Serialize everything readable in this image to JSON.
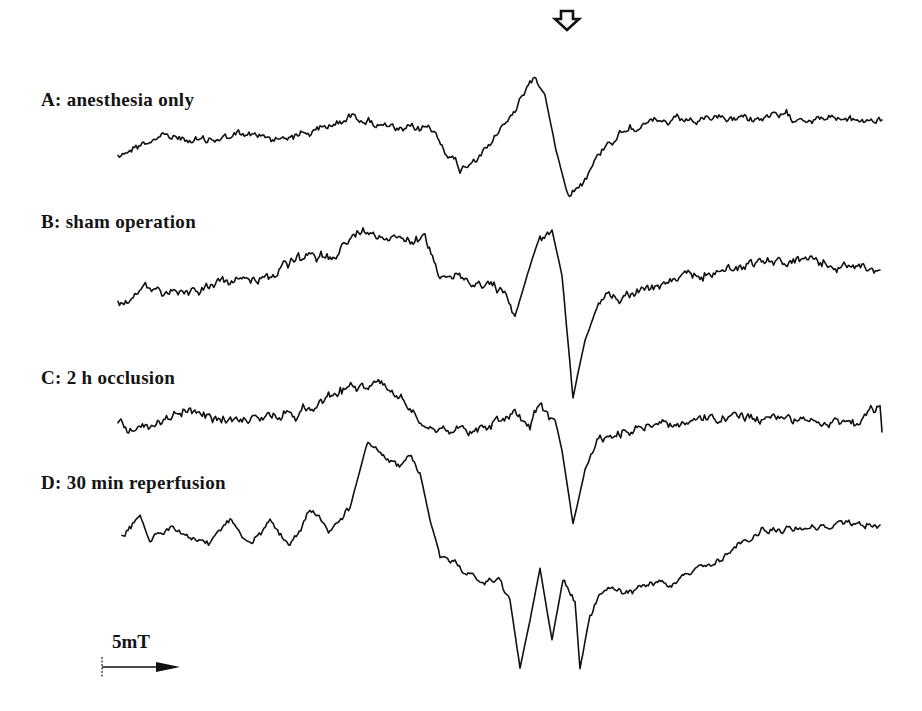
{
  "figure": {
    "marker": "down-arrow-outline",
    "scale_bar": {
      "label": "5mT",
      "direction": "right"
    }
  },
  "labels": {
    "A": "A: anesthesia only",
    "B": "B: sham operation",
    "C": "C: 2 h  occlusion",
    "D": "D: 30 min reperfusion",
    "scale": "5mT"
  },
  "chart_data": {
    "type": "line",
    "title": "",
    "xlabel": "Magnetic field (scale bar 5mT)",
    "ylabel": "",
    "grid": false,
    "legend": "none (inline labels above each trace)",
    "annotations": [
      "open down-arrow marker above center resonance (~x=567)",
      "5mT scale bar arrow at bottom-left"
    ],
    "series": [
      {
        "name": "A: anesthesia only",
        "anchors_px": [
          [
            118,
            155
          ],
          [
            160,
            135
          ],
          [
            200,
            142
          ],
          [
            240,
            135
          ],
          [
            280,
            138
          ],
          [
            320,
            130
          ],
          [
            355,
            115
          ],
          [
            400,
            132
          ],
          [
            430,
            127
          ],
          [
            460,
            170
          ],
          [
            490,
            145
          ],
          [
            515,
            110
          ],
          [
            533,
            75
          ],
          [
            545,
            95
          ],
          [
            556,
            150
          ],
          [
            568,
            195
          ],
          [
            585,
            178
          ],
          [
            605,
            145
          ],
          [
            630,
            125
          ],
          [
            680,
            122
          ],
          [
            740,
            118
          ],
          [
            800,
            117
          ],
          [
            850,
            120
          ],
          [
            882,
            120
          ]
        ],
        "noise": 5
      },
      {
        "name": "B: sham operation",
        "anchors_px": [
          [
            118,
            305
          ],
          [
            150,
            290
          ],
          [
            190,
            290
          ],
          [
            230,
            282
          ],
          [
            270,
            275
          ],
          [
            300,
            260
          ],
          [
            330,
            255
          ],
          [
            345,
            245
          ],
          [
            360,
            232
          ],
          [
            400,
            235
          ],
          [
            425,
            240
          ],
          [
            440,
            272
          ],
          [
            470,
            282
          ],
          [
            500,
            288
          ],
          [
            515,
            318
          ],
          [
            528,
            272
          ],
          [
            540,
            236
          ],
          [
            552,
            230
          ],
          [
            562,
            275
          ],
          [
            573,
            398
          ],
          [
            585,
            340
          ],
          [
            600,
            300
          ],
          [
            640,
            290
          ],
          [
            700,
            275
          ],
          [
            760,
            262
          ],
          [
            810,
            262
          ],
          [
            850,
            268
          ],
          [
            880,
            270
          ]
        ],
        "noise": 6
      },
      {
        "name": "C: 2 h occlusion",
        "anchors_px": [
          [
            118,
            422
          ],
          [
            150,
            432
          ],
          [
            180,
            410
          ],
          [
            220,
            420
          ],
          [
            260,
            418
          ],
          [
            300,
            412
          ],
          [
            330,
            395
          ],
          [
            355,
            385
          ],
          [
            380,
            385
          ],
          [
            410,
            405
          ],
          [
            430,
            425
          ],
          [
            470,
            430
          ],
          [
            500,
            420
          ],
          [
            515,
            410
          ],
          [
            530,
            425
          ],
          [
            540,
            405
          ],
          [
            555,
            420
          ],
          [
            562,
            450
          ],
          [
            573,
            523
          ],
          [
            585,
            470
          ],
          [
            600,
            440
          ],
          [
            640,
            425
          ],
          [
            700,
            420
          ],
          [
            760,
            418
          ],
          [
            820,
            420
          ],
          [
            860,
            423
          ],
          [
            880,
            410
          ],
          [
            882,
            432
          ]
        ],
        "noise": 6
      },
      {
        "name": "D: 30 min reperfusion",
        "anchors_px": [
          [
            122,
            538
          ],
          [
            140,
            515
          ],
          [
            150,
            542
          ],
          [
            170,
            525
          ],
          [
            190,
            540
          ],
          [
            210,
            545
          ],
          [
            230,
            520
          ],
          [
            250,
            545
          ],
          [
            270,
            520
          ],
          [
            290,
            548
          ],
          [
            310,
            510
          ],
          [
            330,
            530
          ],
          [
            350,
            508
          ],
          [
            368,
            440
          ],
          [
            385,
            455
          ],
          [
            398,
            465
          ],
          [
            410,
            460
          ],
          [
            420,
            470
          ],
          [
            430,
            520
          ],
          [
            440,
            555
          ],
          [
            455,
            565
          ],
          [
            480,
            580
          ],
          [
            500,
            580
          ],
          [
            510,
            600
          ],
          [
            520,
            668
          ],
          [
            530,
            620
          ],
          [
            540,
            568
          ],
          [
            552,
            640
          ],
          [
            563,
            580
          ],
          [
            575,
            600
          ],
          [
            580,
            668
          ],
          [
            590,
            615
          ],
          [
            605,
            590
          ],
          [
            625,
            593
          ],
          [
            650,
            583
          ],
          [
            670,
            585
          ],
          [
            700,
            570
          ],
          [
            730,
            555
          ],
          [
            760,
            530
          ],
          [
            800,
            528
          ],
          [
            840,
            525
          ],
          [
            880,
            525
          ]
        ],
        "noise": 4
      }
    ]
  }
}
